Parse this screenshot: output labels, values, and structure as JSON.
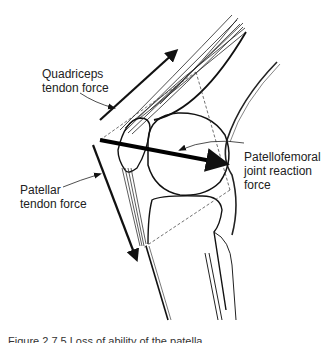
{
  "labels": {
    "quadriceps_tendon_force": "Quadriceps\ntendon force",
    "patellar_tendon_force": "Patellar\ntendon force",
    "patellofemoral_joint_reaction_force": "Patellofemoral\njoint reaction\nforce"
  },
  "caption": "Figure 2.7.5 Loss of ability of the patella...",
  "colors": {
    "ink": "#1a1a1a",
    "background": "#ffffff"
  }
}
